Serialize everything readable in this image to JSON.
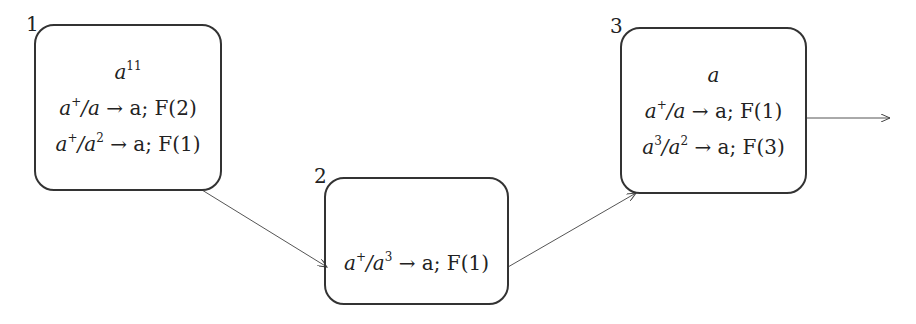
{
  "diagram": {
    "type": "spiking-neural-p-system",
    "neurons": [
      {
        "id": "1",
        "label": "1",
        "spikes": "a^11",
        "rules": [
          "a^+/a → a; F(2)",
          "a^+/a^2 → a; F(1)"
        ]
      },
      {
        "id": "2",
        "label": "2",
        "spikes": "",
        "rules": [
          "a^+/a^3 → a; F(1)"
        ]
      },
      {
        "id": "3",
        "label": "3",
        "spikes": "a",
        "rules": [
          "a^+/a → a; F(1)",
          "a^3/a^2 → a; F(3)"
        ]
      }
    ],
    "edges": [
      {
        "from": "1",
        "to": "2"
      },
      {
        "from": "2",
        "to": "3"
      },
      {
        "from": "3",
        "to": "environment"
      }
    ]
  },
  "n1": {
    "label": "1",
    "spk_base": "a",
    "spk_exp": "11",
    "r1": {
      "a": "a",
      "e1": "+",
      "b": "/a",
      "arrow": " → a; F(2)"
    },
    "r2": {
      "a": "a",
      "e1": "+",
      "b": "/a",
      "e2": "2",
      "arrow": " → a; F(1)"
    }
  },
  "n2": {
    "label": "2",
    "r1": {
      "a": "a",
      "e1": "+",
      "b": "/a",
      "e2": "3",
      "arrow": " → a; F(1)"
    }
  },
  "n3": {
    "label": "3",
    "spk_base": "a",
    "r1": {
      "a": "a",
      "e1": "+",
      "b": "/a",
      "arrow": " → a; F(1)"
    },
    "r2": {
      "a": "a",
      "e1": "3",
      "b": "/a",
      "e2": "2",
      "arrow": " → a; F(3)"
    }
  }
}
